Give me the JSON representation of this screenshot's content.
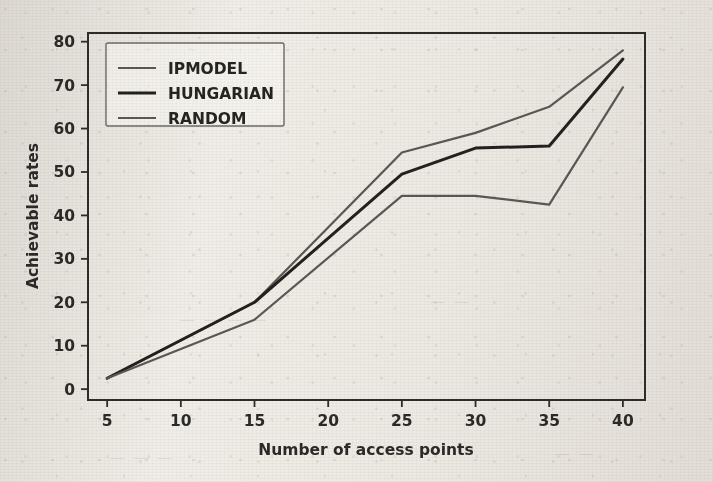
{
  "figure": {
    "background_color": "#efece6",
    "frame_color": "#2e2c29",
    "ghost_marks": [
      {
        "text": "— — — — —",
        "x": 180,
        "y": 320
      },
      {
        "text": "— — —",
        "x": 430,
        "y": 300
      },
      {
        "text": "— — — —",
        "x": 120,
        "y": 455
      },
      {
        "text": "— —",
        "x": 560,
        "y": 450
      }
    ]
  },
  "chart_data": {
    "type": "line",
    "title": "",
    "subtitle": "",
    "xlabel": "Number of access points",
    "ylabel": "Achievable rates",
    "x": [
      5,
      15,
      25,
      30,
      35,
      40
    ],
    "xlim": [
      3.7,
      41.5
    ],
    "ylim": [
      -2.5,
      82
    ],
    "xticks": [
      5,
      10,
      15,
      20,
      25,
      30,
      35,
      40
    ],
    "yticks": [
      0,
      10,
      20,
      30,
      40,
      50,
      60,
      70,
      80
    ],
    "xtick_labels": [
      "5",
      "10",
      "15",
      "20",
      "25",
      "30",
      "35",
      "40"
    ],
    "ytick_labels": [
      "0",
      "10",
      "20",
      "30",
      "40",
      "50",
      "60",
      "70",
      "80"
    ],
    "grid": false,
    "legend_position": "upper left",
    "series": [
      {
        "name": "IPMODEL",
        "color": "#5b5853",
        "width": 2.2,
        "values": [
          2.5,
          20.0,
          54.5,
          59.0,
          65.0,
          78.0
        ]
      },
      {
        "name": "HUNGARIAN",
        "color": "#232120",
        "width": 3.0,
        "values": [
          2.5,
          20.0,
          49.5,
          55.5,
          56.0,
          76.0
        ]
      },
      {
        "name": "RANDOM",
        "color": "#5b5853",
        "width": 2.2,
        "values": [
          2.5,
          16.0,
          44.5,
          44.5,
          42.5,
          69.5
        ]
      }
    ]
  }
}
